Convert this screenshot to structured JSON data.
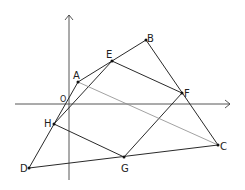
{
  "diagram": {
    "title": "",
    "axes": {
      "origin_label": "O",
      "x_axis": {
        "x1": 15,
        "x2": 230,
        "y": 104
      },
      "y_axis": {
        "x": 69,
        "y1": 180,
        "y2": 15
      }
    },
    "points": {
      "A": {
        "label": "A",
        "x": 78,
        "y": 82
      },
      "B": {
        "label": "B",
        "x": 146,
        "y": 40
      },
      "C": {
        "label": "C",
        "x": 218,
        "y": 145
      },
      "D": {
        "label": "D",
        "x": 29,
        "y": 168
      },
      "E": {
        "label": "E",
        "x": 112,
        "y": 61
      },
      "F": {
        "label": "F",
        "x": 182,
        "y": 93
      },
      "G": {
        "label": "G",
        "x": 124,
        "y": 157
      },
      "H": {
        "label": "H",
        "x": 54,
        "y": 124
      }
    },
    "segments": [
      [
        "A",
        "B"
      ],
      [
        "B",
        "C"
      ],
      [
        "C",
        "D"
      ],
      [
        "D",
        "A"
      ],
      [
        "E",
        "F"
      ],
      [
        "F",
        "G"
      ],
      [
        "G",
        "H"
      ],
      [
        "H",
        "E"
      ],
      [
        "A",
        "C"
      ]
    ],
    "colors": {
      "line": "#2a2a2a",
      "diagonal": "#8a8a8a",
      "axis": "#444444"
    }
  }
}
